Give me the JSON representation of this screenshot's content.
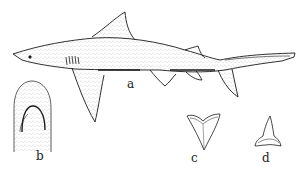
{
  "figure": {
    "panels": [
      {
        "id": "a",
        "label": "a",
        "subject": "shark-lateral-view"
      },
      {
        "id": "b",
        "label": "b",
        "subject": "snout-ventral-view"
      },
      {
        "id": "c",
        "label": "c",
        "subject": "upper-tooth"
      },
      {
        "id": "d",
        "label": "d",
        "subject": "lower-tooth"
      }
    ],
    "colors": {
      "ink": "#1a1a1a",
      "background": "#ffffff"
    }
  }
}
